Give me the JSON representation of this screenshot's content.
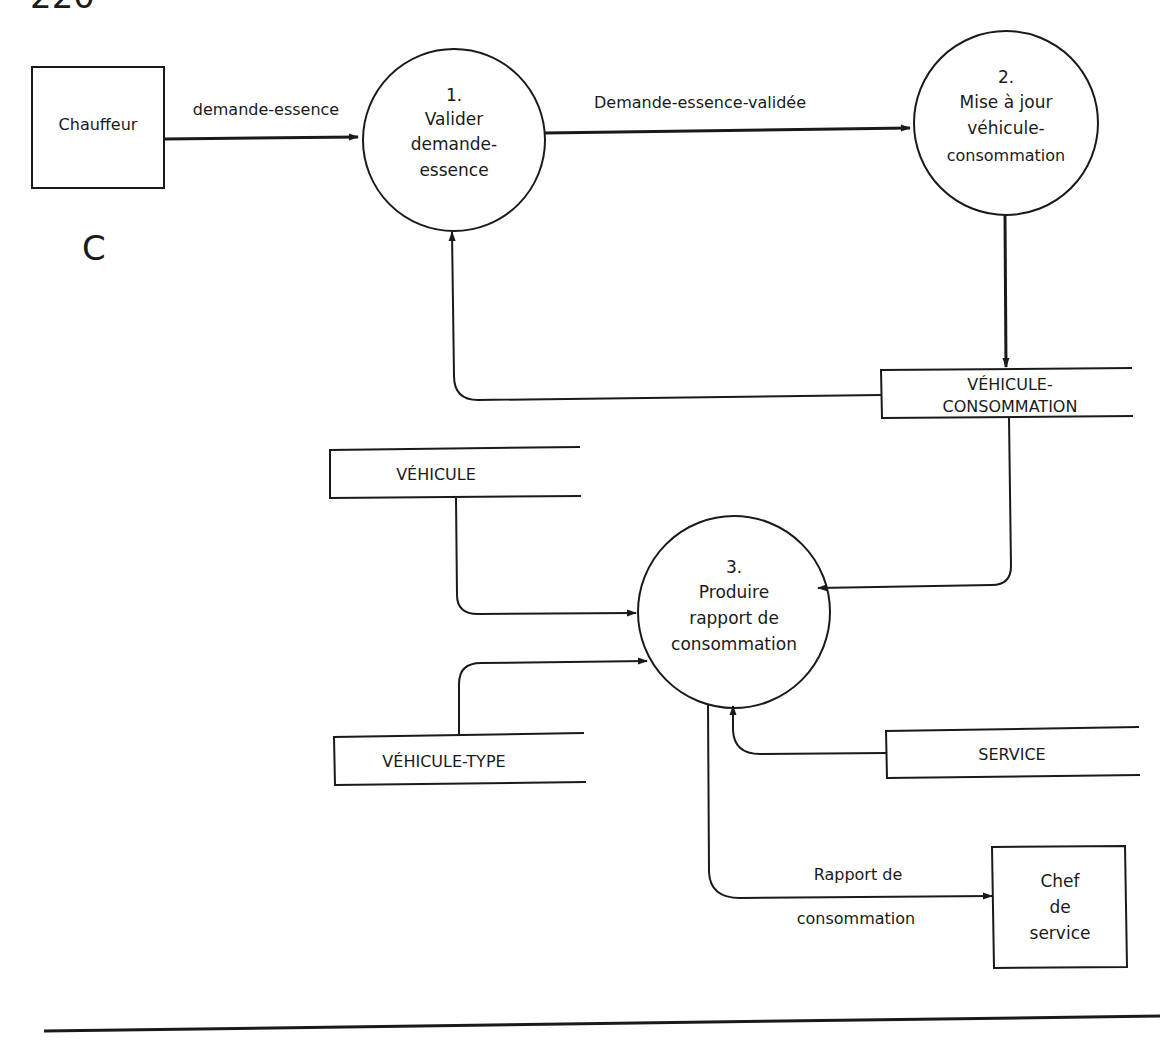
{
  "page": {
    "number": "220",
    "section_letter": "C"
  },
  "external_entities": [
    {
      "id": "chauffeur",
      "label": "Chauffeur"
    },
    {
      "id": "chef-de-service",
      "lines": [
        "Chef",
        "de",
        "service"
      ]
    }
  ],
  "processes": [
    {
      "id": "p1",
      "number": "1.",
      "lines": [
        "Valider",
        "demande-",
        "essence"
      ]
    },
    {
      "id": "p2",
      "number": "2.",
      "lines": [
        "Mise à jour",
        "véhicule-",
        "consommation"
      ]
    },
    {
      "id": "p3",
      "number": "3.",
      "lines": [
        "Produire",
        "rapport de",
        "consommation"
      ]
    }
  ],
  "data_stores": [
    {
      "id": "vehicule-consommation",
      "lines": [
        "VÉHICULE-",
        "CONSOMMATION"
      ]
    },
    {
      "id": "vehicule",
      "label": "VÉHICULE"
    },
    {
      "id": "vehicule-type",
      "label": "VÉHICULE-TYPE"
    },
    {
      "id": "service",
      "label": "SERVICE"
    }
  ],
  "flows": [
    {
      "from": "chauffeur",
      "to": "p1",
      "label": "demande-essence"
    },
    {
      "from": "p1",
      "to": "p2",
      "label": "Demande-essence-validée"
    },
    {
      "from": "p2",
      "to": "vehicule-consommation",
      "label": ""
    },
    {
      "from": "vehicule-consommation",
      "to": "p1",
      "label": ""
    },
    {
      "from": "vehicule-consommation",
      "to": "p3",
      "label": ""
    },
    {
      "from": "vehicule",
      "to": "p3",
      "label": ""
    },
    {
      "from": "vehicule-type",
      "to": "p3",
      "label": ""
    },
    {
      "from": "service",
      "to": "p3",
      "label": ""
    },
    {
      "from": "p3",
      "to": "chef-de-service",
      "label_lines": [
        "Rapport de",
        "consommation"
      ]
    }
  ]
}
